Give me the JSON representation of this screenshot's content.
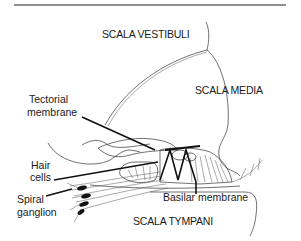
{
  "diagram": {
    "type": "anatomical cross-section",
    "regions": {
      "scala_vestibuli": "SCALA VESTIBULI",
      "scala_media": "SCALA MEDIA",
      "scala_tympani": "SCALA TYMPANI"
    },
    "labels": {
      "tectorial_line1": "Tectorial",
      "tectorial_line2": "membrane",
      "hair_line1": "Hair",
      "hair_line2": "cells",
      "spiral_line1": "Spiral",
      "spiral_line2": "ganglion",
      "basilar": "Basilar membrane"
    },
    "colors": {
      "line": "#333333",
      "leader": "#111111",
      "background": "#ffffff"
    }
  }
}
